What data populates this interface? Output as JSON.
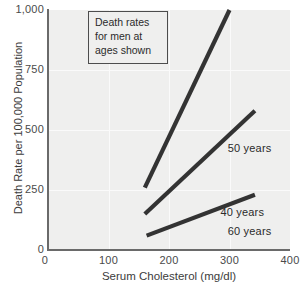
{
  "chart_data": {
    "type": "line",
    "title": "",
    "subtitle": "",
    "xlabel": "Serum Cholesterol (mg/dl)",
    "ylabel": "Death Rate per 100,000 Population",
    "xlim": [
      0,
      400
    ],
    "ylim": [
      0,
      1000
    ],
    "xticks": [
      "0",
      "100",
      "200",
      "300",
      "400"
    ],
    "xtick_values": [
      0,
      100,
      200,
      300,
      400
    ],
    "yticks": [
      "0",
      "250",
      "500",
      "750",
      "1,000"
    ],
    "ytick_values": [
      0,
      250,
      500,
      750,
      1000
    ],
    "grid": true,
    "legend_position": "inline-right-of-lines",
    "annotation": {
      "lines": [
        "Death rates",
        "for men at",
        "ages shown"
      ],
      "box": true
    },
    "series": [
      {
        "name": "60 years",
        "label": "60 years",
        "color": "#333333",
        "points": [
          {
            "x": 160,
            "y": 260
          },
          {
            "x": 300,
            "y": 1000
          }
        ],
        "label_position": {
          "x": 297,
          "y": 75
        }
      },
      {
        "name": "50 years",
        "label": "50 years",
        "color": "#333333",
        "points": [
          {
            "x": 160,
            "y": 150
          },
          {
            "x": 342,
            "y": 580
          }
        ],
        "label_position": {
          "x": 297,
          "y": 420
        }
      },
      {
        "name": "40 years",
        "label": "40 years",
        "color": "#333333",
        "points": [
          {
            "x": 163,
            "y": 60
          },
          {
            "x": 342,
            "y": 230
          }
        ],
        "label_position": {
          "x": 285,
          "y": 155
        }
      }
    ]
  },
  "colors": {
    "plot_background": "#efefee",
    "page_background": "#ffffff",
    "axis": "#6a6a6a",
    "gridline": "#fafafa",
    "line": "#333333",
    "text": "#3c3c3c"
  }
}
